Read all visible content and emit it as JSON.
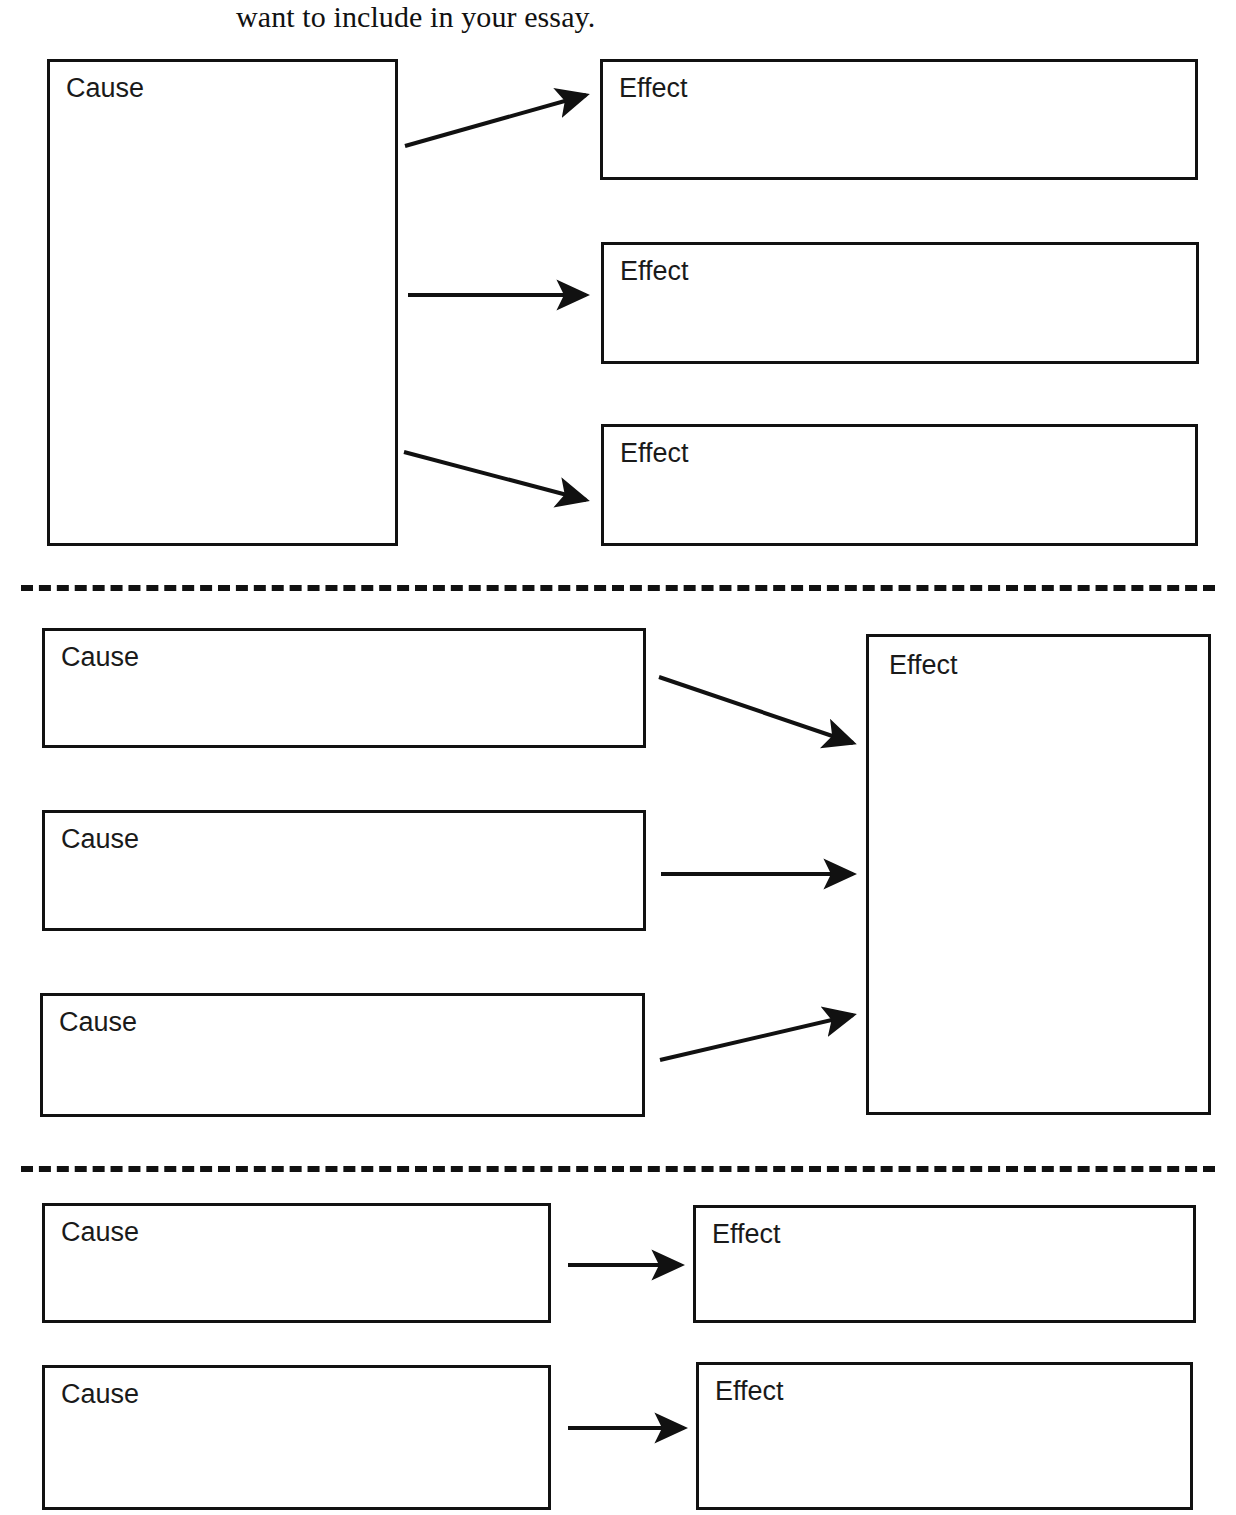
{
  "page": {
    "header_text": "want to include in your essay.",
    "width": 1236,
    "height": 1515,
    "background_color": "#ffffff",
    "ink_color": "#111111"
  },
  "labels": {
    "cause": "Cause",
    "effect": "Effect"
  },
  "diagram": {
    "type": "cause-and-effect graphic organizer",
    "sections": [
      {
        "id": "one-cause-many-effects",
        "cause_boxes": [
          {
            "label": "Cause",
            "x": 47,
            "y": 59,
            "w": 351,
            "h": 487
          }
        ],
        "effect_boxes": [
          {
            "label": "Effect",
            "x": 600,
            "y": 59,
            "w": 598,
            "h": 121
          },
          {
            "label": "Effect",
            "x": 601,
            "y": 242,
            "w": 598,
            "h": 122
          },
          {
            "label": "Effect",
            "x": 601,
            "y": 424,
            "w": 597,
            "h": 122
          }
        ],
        "arrows": [
          {
            "from": "cause",
            "to": "effect-1",
            "x1": 405,
            "y1": 146,
            "x2": 590,
            "y2": 95,
            "style": "up-right"
          },
          {
            "from": "cause",
            "to": "effect-2",
            "x1": 408,
            "y1": 295,
            "x2": 590,
            "y2": 295,
            "style": "horizontal"
          },
          {
            "from": "cause",
            "to": "effect-3",
            "x1": 404,
            "y1": 452,
            "x2": 591,
            "y2": 500,
            "style": "down-right"
          }
        ]
      },
      {
        "id": "many-causes-one-effect",
        "cause_boxes": [
          {
            "label": "Cause",
            "x": 42,
            "y": 628,
            "w": 604,
            "h": 120
          },
          {
            "label": "Cause",
            "x": 42,
            "y": 810,
            "w": 604,
            "h": 121
          },
          {
            "label": "Cause",
            "x": 40,
            "y": 993,
            "w": 605,
            "h": 124
          }
        ],
        "effect_boxes": [
          {
            "label": "Effect",
            "x": 866,
            "y": 634,
            "w": 345,
            "h": 481
          }
        ],
        "arrows": [
          {
            "from": "cause-1",
            "to": "effect",
            "x1": 659,
            "y1": 677,
            "x2": 856,
            "y2": 742,
            "style": "down-right"
          },
          {
            "from": "cause-2",
            "to": "effect",
            "x1": 661,
            "y1": 874,
            "x2": 856,
            "y2": 874,
            "style": "horizontal"
          },
          {
            "from": "cause-3",
            "to": "effect",
            "x1": 660,
            "y1": 1060,
            "x2": 856,
            "y2": 1014,
            "style": "up-right"
          }
        ]
      },
      {
        "id": "paired-cause-effect",
        "cause_boxes": [
          {
            "label": "Cause",
            "x": 42,
            "y": 1203,
            "w": 509,
            "h": 120
          },
          {
            "label": "Cause",
            "x": 42,
            "y": 1365,
            "w": 509,
            "h": 145
          }
        ],
        "effect_boxes": [
          {
            "label": "Effect",
            "x": 693,
            "y": 1205,
            "w": 503,
            "h": 118
          },
          {
            "label": "Effect",
            "x": 696,
            "y": 1362,
            "w": 497,
            "h": 148
          }
        ],
        "arrows": [
          {
            "from": "cause-1",
            "to": "effect-1",
            "x1": 568,
            "y1": 1265,
            "x2": 685,
            "y2": 1265,
            "style": "horizontal"
          },
          {
            "from": "cause-2",
            "to": "effect-2",
            "x1": 568,
            "y1": 1428,
            "x2": 685,
            "y2": 1428,
            "style": "horizontal"
          }
        ]
      }
    ],
    "dividers": [
      {
        "y": 585
      },
      {
        "y": 1166
      }
    ]
  }
}
